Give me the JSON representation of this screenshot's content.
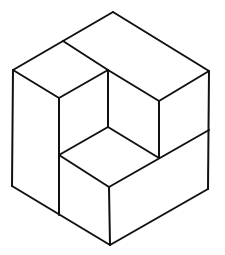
{
  "figure": {
    "caption_clipped": "",
    "stroke_color": "#111111",
    "background_color": "#ffffff"
  }
}
